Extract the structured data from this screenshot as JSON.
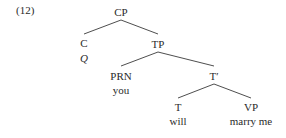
{
  "example_number": "(12)",
  "tree": {
    "root": {
      "label": "CP"
    },
    "c": {
      "label": "C",
      "word": "Q"
    },
    "tp": {
      "label": "TP"
    },
    "prn": {
      "label": "PRN",
      "word": "you"
    },
    "tbar": {
      "label": "T′"
    },
    "t": {
      "label": "T",
      "word": "will"
    },
    "vp": {
      "label": "VP",
      "word": "marry me"
    }
  },
  "colors": {
    "text": "#2a2a2a",
    "line": "#3a3a3a",
    "background": "#ffffff"
  }
}
